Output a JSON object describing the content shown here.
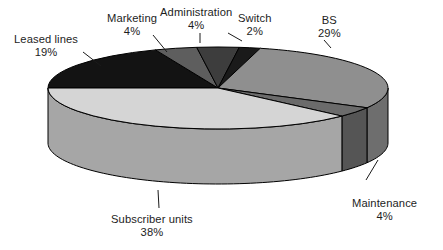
{
  "chart_data": {
    "type": "pie",
    "title": "",
    "subtitle": "",
    "xlabel": "",
    "ylabel": "",
    "legend_position": "none",
    "grid": false,
    "value_unit": "%",
    "total": 100,
    "style": "3d-exploded-disc",
    "categories": [
      "Leased lines",
      "Marketing",
      "Administration",
      "Switch",
      "BS",
      "Maintenance",
      "Subscriber units"
    ],
    "values": [
      19,
      4,
      4,
      2,
      29,
      4,
      38
    ],
    "slices": [
      {
        "label": "Leased lines",
        "value": 19,
        "value_text": "19%",
        "color": "#131313",
        "side_color": "#0d0d0d"
      },
      {
        "label": "Marketing",
        "value": 4,
        "value_text": "4%",
        "color": "#5e5e5e",
        "side_color": "#474747"
      },
      {
        "label": "Administration",
        "value": 4,
        "value_text": "4%",
        "color": "#3d3d3d",
        "side_color": "#2e2e2e"
      },
      {
        "label": "Switch",
        "value": 2,
        "value_text": "2%",
        "color": "#1a1a1a",
        "side_color": "#121212"
      },
      {
        "label": "BS",
        "value": 29,
        "value_text": "29%",
        "color": "#8f8f8f",
        "side_color": "#6e6e6e"
      },
      {
        "label": "Maintenance",
        "value": 4,
        "value_text": "4%",
        "color": "#6b6b6b",
        "side_color": "#555555"
      },
      {
        "label": "Subscriber units",
        "value": 38,
        "value_text": "38%",
        "color": "#d5d5d5",
        "side_color": "#a6a6a6"
      }
    ]
  },
  "geometry": {
    "cx": 218,
    "cy": 88,
    "rx": 170,
    "ry": 41,
    "depth": 55,
    "start_angle_deg": 180,
    "direction": "clockwise",
    "stroke": "#000000",
    "stroke_width": 1
  },
  "labels": [
    {
      "name": "Leased lines",
      "value_text": "19%",
      "x": 14,
      "y": 33,
      "leader": {
        "x1": 83,
        "y1": 52,
        "x2": 101,
        "y2": 66
      }
    },
    {
      "name": "Marketing",
      "value_text": "4%",
      "x": 107,
      "y": 12,
      "leader": {
        "x1": 153,
        "y1": 35,
        "x2": 167,
        "y2": 52
      }
    },
    {
      "name": "Administration",
      "value_text": "4%",
      "x": 160,
      "y": 6,
      "leader": {
        "x1": 200,
        "y1": 33,
        "x2": 200,
        "y2": 43
      }
    },
    {
      "name": "Switch",
      "value_text": "2%",
      "x": 238,
      "y": 12,
      "leader": {
        "x1": 242,
        "y1": 41,
        "x2": 228,
        "y2": 33
      }
    },
    {
      "name": "BS",
      "value_text": "29%",
      "x": 318,
      "y": 14,
      "leader": {
        "x1": 331,
        "y1": 48,
        "x2": 324,
        "y2": 40
      }
    },
    {
      "name": "Maintenance",
      "value_text": "4%",
      "x": 352,
      "y": 197,
      "leader": {
        "x1": 366,
        "y1": 180,
        "x2": 378,
        "y2": 160
      }
    },
    {
      "name": "Subscriber units",
      "value_text": "38%",
      "x": 111,
      "y": 213,
      "leader": {
        "x1": 158,
        "y1": 190,
        "x2": 159,
        "y2": 208
      }
    }
  ]
}
